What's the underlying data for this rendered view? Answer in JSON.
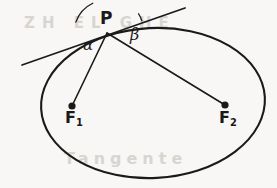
{
  "figure": {
    "kind": "geometry-diagram",
    "width": 277,
    "height": 188,
    "background_color": "#f8f7f5",
    "ink_color": "#1a1a1a",
    "ghost_color": "#d8d5d0"
  },
  "labels": {
    "point_p": "P",
    "focus_1_base": "F",
    "focus_1_sub": "1",
    "focus_2_base": "F",
    "focus_2_sub": "2",
    "angle_alpha": "α",
    "angle_beta": "β"
  },
  "ghost_text": {
    "line_top": "ZH  EL  GHE",
    "line_bottom": "Tangente"
  },
  "geometry": {
    "ellipse": {
      "center_x": 153,
      "center_y": 103,
      "radius_x": 112,
      "radius_y": 75,
      "rotation_deg": -3,
      "stroke_width": 2.1
    },
    "point_p": {
      "x": 107,
      "y": 33
    },
    "focus_1": {
      "x": 72,
      "y": 106,
      "dot_radius": 3.6
    },
    "focus_2": {
      "x": 225,
      "y": 105,
      "dot_radius": 3.6
    },
    "tangent_line": {
      "x1": 22,
      "y1": 65,
      "x2": 185,
      "y2": 8,
      "stroke_width": 1.7
    },
    "focal_radius_1": {
      "x1": 107,
      "y1": 33,
      "x2": 72,
      "y2": 106,
      "stroke_width": 1.6
    },
    "focal_radius_2": {
      "x1": 107,
      "y1": 33,
      "x2": 225,
      "y2": 105,
      "stroke_width": 1.6
    },
    "angle_arc_alpha": {
      "vertex_x": 107,
      "vertex_y": 33,
      "radius": 33,
      "start_deg": 160.7,
      "end_deg": 115.6
    },
    "angle_arc_beta": {
      "vertex_x": 107,
      "vertex_y": 33,
      "radius": 37,
      "start_deg": 19.3,
      "end_deg": 31.4
    }
  }
}
